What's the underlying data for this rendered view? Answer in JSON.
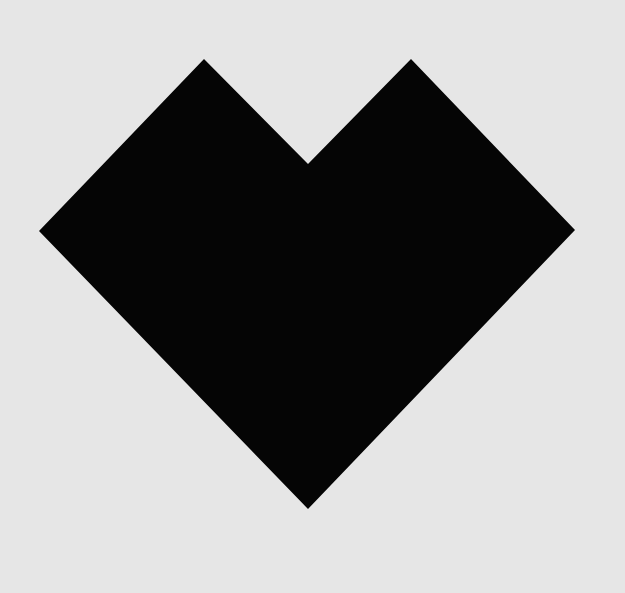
{
  "canvas": {
    "width": 625,
    "height": 593,
    "background": "#e6e6e6"
  },
  "shape": {
    "kind": "heart",
    "fill": "#050505",
    "points": "39,231 204,59 308,164 411,59 575,230 308,509"
  }
}
